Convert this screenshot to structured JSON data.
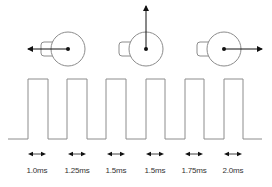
{
  "colors": {
    "line": "#8c8c8c",
    "arrow": "#111111",
    "text": "#333333",
    "background": "#ffffff"
  },
  "servos": [
    {
      "name": "servo-left",
      "cx": 68,
      "cy": 49,
      "r": 17,
      "tab_side": "left",
      "direction": "left",
      "arrow_to": [
        28,
        49
      ]
    },
    {
      "name": "servo-center",
      "cx": 146,
      "cy": 49,
      "r": 17,
      "tab_side": "left",
      "direction": "up",
      "arrow_to": [
        146,
        6
      ]
    },
    {
      "name": "servo-right",
      "cx": 224,
      "cy": 49,
      "r": 17,
      "tab_side": "left",
      "direction": "right",
      "arrow_to": [
        262,
        49
      ]
    }
  ],
  "waveform": {
    "baseline_y": 139,
    "high_y": 79,
    "start_x": 8,
    "end_x": 262,
    "pulses": [
      {
        "rise": 28,
        "fall": 48
      },
      {
        "rise": 67,
        "fall": 87
      },
      {
        "rise": 106,
        "fall": 126
      },
      {
        "rise": 146,
        "fall": 165
      },
      {
        "rise": 185,
        "fall": 204
      },
      {
        "rise": 224,
        "fall": 243
      }
    ]
  },
  "pulse_widths": [
    {
      "label": "1.0ms",
      "x": 37
    },
    {
      "label": "1.25ms",
      "x": 77
    },
    {
      "label": "1.5ms",
      "x": 116
    },
    {
      "label": "1.5ms",
      "x": 155
    },
    {
      "label": "1.75ms",
      "x": 194
    },
    {
      "label": "2.0ms",
      "x": 233
    }
  ]
}
